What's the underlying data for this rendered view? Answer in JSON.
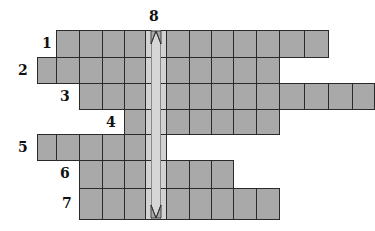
{
  "puzzle": {
    "type": "crossword",
    "highlight_column": 5,
    "vertical_clue_number": "8",
    "colors": {
      "cell": "#a9a9a9",
      "highlight": "#d2d2d2",
      "border": "#2a2a2a"
    },
    "col_x": [
      37,
      56,
      79,
      102,
      124,
      145,
      166,
      189,
      211,
      233,
      256,
      279,
      304,
      328,
      352
    ],
    "rows": [
      {
        "number": "1",
        "top": 30,
        "bottom": 57,
        "start": 1,
        "end": 12,
        "label_x": 42,
        "label_y": 36
      },
      {
        "number": "2",
        "top": 57,
        "bottom": 83,
        "start": 0,
        "end": 10,
        "label_x": 18,
        "label_y": 63
      },
      {
        "number": "3",
        "top": 83,
        "bottom": 109,
        "start": 2,
        "end": 14,
        "label_x": 60,
        "label_y": 89
      },
      {
        "number": "4",
        "top": 109,
        "bottom": 134,
        "start": 4,
        "end": 10,
        "label_x": 106,
        "label_y": 115
      },
      {
        "number": "5",
        "top": 134,
        "bottom": 160,
        "start": 0,
        "end": 5,
        "label_x": 18,
        "label_y": 140
      },
      {
        "number": "6",
        "top": 160,
        "bottom": 188,
        "start": 2,
        "end": 8,
        "label_x": 60,
        "label_y": 166
      },
      {
        "number": "7",
        "top": 188,
        "bottom": 219,
        "start": 2,
        "end": 10,
        "label_x": 62,
        "label_y": 196
      }
    ]
  }
}
